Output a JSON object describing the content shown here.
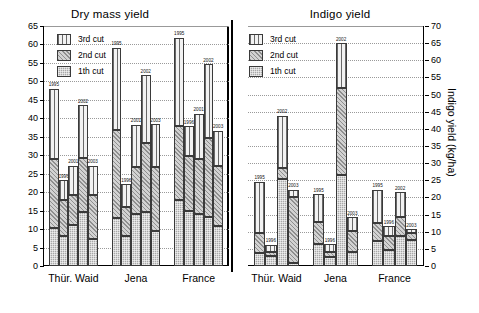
{
  "figure": {
    "left_panel_title": "Dry mass yield",
    "right_panel_title": "Indigo yield"
  },
  "legend": {
    "items": [
      {
        "label": "3rd cut",
        "pattern": "vertical-lines"
      },
      {
        "label": "2nd cut",
        "pattern": "diagonal-hatch"
      },
      {
        "label": "1th cut",
        "pattern": "dotted-dark"
      }
    ]
  },
  "chart_data": [
    {
      "type": "bar",
      "subtype": "stacked",
      "title": "Dry mass yield",
      "xlabel": "",
      "ylabel": "Dry mass yield (dt/ha)",
      "ylim": [
        0,
        65
      ],
      "yticks": [
        0,
        5,
        10,
        15,
        20,
        25,
        30,
        35,
        40,
        45,
        50,
        55,
        60,
        65
      ],
      "ytick_labels": [
        "0",
        "5",
        "10",
        "15",
        "20",
        "25",
        "30",
        "35",
        "40",
        "45",
        "50",
        "55",
        "60",
        "65"
      ],
      "grid": true,
      "legend_position": "upper-left",
      "categories": [
        "Thür. Waid",
        "Jena",
        "France"
      ],
      "years": [
        "1995",
        "1996",
        "2001",
        "2002",
        "2003"
      ],
      "series": [
        {
          "name": "1th cut",
          "values": [
            [
              10.4,
              8.0,
              11.0,
              14.6,
              7.2
            ],
            [
              13.0,
              8.0,
              14.0,
              14.6,
              9.5
            ],
            [
              17.9,
              14.9,
              14.2,
              13.2,
              10.9
            ]
          ]
        },
        {
          "name": "2nd cut",
          "values": [
            [
              18.6,
              10.0,
              8.3,
              14.6,
              11.9
            ],
            [
              23.9,
              8.0,
              12.8,
              18.6,
              17.3
            ],
            [
              20.0,
              14.9,
              14.8,
              21.4,
              16.3
            ]
          ]
        },
        {
          "name": "3rd cut",
          "values": [
            [
              19.0,
              5.2,
              7.9,
              14.3,
              8.1
            ],
            [
              22.2,
              6.2,
              11.5,
              18.5,
              11.6
            ],
            [
              23.9,
              8.1,
              12.2,
              20.0,
              9.4
            ]
          ]
        }
      ],
      "totals": [
        [
          48.0,
          23.2,
          27.2,
          43.5,
          27.2
        ],
        [
          59.1,
          22.2,
          38.3,
          51.7,
          38.4
        ],
        [
          61.8,
          37.9,
          41.2,
          54.6,
          36.6
        ]
      ]
    },
    {
      "type": "bar",
      "subtype": "stacked",
      "title": "Indigo yield",
      "xlabel": "",
      "ylabel": "Indigo yield (kg/ha)",
      "ylim": [
        0,
        70
      ],
      "yticks": [
        0,
        5,
        10,
        15,
        20,
        25,
        30,
        35,
        40,
        45,
        50,
        55,
        60,
        65,
        70
      ],
      "ytick_labels": [
        "0",
        "5",
        "10",
        "15",
        "20",
        "25",
        "30",
        "35",
        "40",
        "45",
        "50",
        "55",
        "60",
        "65",
        "70"
      ],
      "grid": true,
      "legend_position": "upper-left",
      "categories": [
        "Thür. Waid",
        "Jena",
        "France"
      ],
      "years": [
        "1995",
        "1996",
        "2002",
        "2003"
      ],
      "series": [
        {
          "name": "1th cut",
          "values": [
            [
              3.9,
              2.9,
              25.5,
              1.0
            ],
            [
              6.4,
              2.5,
              26.6,
              4.0
            ],
            [
              7.4,
              4.6,
              8.8,
              7.5
            ]
          ]
        },
        {
          "name": "2nd cut",
          "values": [
            [
              5.6,
              1.2,
              3.1,
              19.1
            ],
            [
              6.5,
              1.5,
              25.4,
              6.2
            ],
            [
              5.1,
              4.3,
              5.4,
              2.2
            ]
          ]
        },
        {
          "name": "3rd cut",
          "values": [
            [
              15.1,
              2.1,
              15.2,
              2.2
            ],
            [
              8.1,
              2.3,
              13.0,
              4.0
            ],
            [
              9.7,
              2.7,
              7.3,
              1.0
            ]
          ]
        }
      ],
      "totals": [
        [
          24.6,
          6.2,
          43.8,
          22.3
        ],
        [
          21.0,
          6.3,
          65.0,
          14.2
        ],
        [
          22.2,
          11.6,
          21.5,
          10.7
        ]
      ]
    }
  ]
}
